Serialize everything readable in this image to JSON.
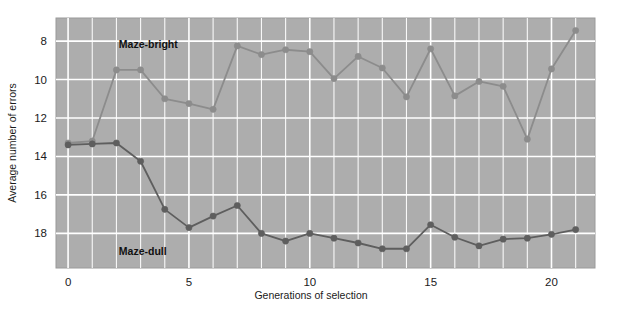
{
  "chart_data": {
    "type": "line",
    "title": "",
    "xlabel": "Generations of selection",
    "ylabel": "Average number of errors",
    "xlim": [
      -0.5,
      21.8
    ],
    "ylim": [
      19.8,
      6.8
    ],
    "y_inverted": true,
    "grid": true,
    "grid_color": "#ffffff",
    "plot_background": "#adadad",
    "legend_position": "inline-annotation",
    "xticks": [
      0,
      5,
      10,
      15,
      20
    ],
    "xtick_labels": [
      "0",
      "5",
      "10",
      "15",
      "20"
    ],
    "yticks": [
      8,
      10,
      12,
      14,
      16,
      18
    ],
    "ytick_labels": [
      "8",
      "10",
      "12",
      "14",
      "16",
      "18"
    ],
    "x_minor_step": 1,
    "y_minor_step": 1,
    "x": [
      0,
      1,
      2,
      3,
      4,
      5,
      6,
      7,
      8,
      9,
      10,
      11,
      12,
      13,
      14,
      15,
      16,
      17,
      18,
      19,
      20,
      21
    ],
    "series": [
      {
        "name": "Maze-bright",
        "color": "#8c8c8c",
        "marker": "circle",
        "annotation": "Maze-bright",
        "annotation_x": 2.1,
        "annotation_y": 8.35,
        "values": [
          13.3,
          13.2,
          9.5,
          9.5,
          11.0,
          11.25,
          11.55,
          8.25,
          8.7,
          8.45,
          8.55,
          9.95,
          8.8,
          9.4,
          10.9,
          8.4,
          10.85,
          10.1,
          10.35,
          13.1,
          9.45,
          7.45
        ]
      },
      {
        "name": "Maze-dull",
        "color": "#5e5e5e",
        "marker": "circle",
        "annotation": "Maze-dull",
        "annotation_x": 2.1,
        "annotation_y": 19.1,
        "values": [
          13.4,
          13.35,
          13.3,
          14.25,
          16.75,
          17.7,
          17.1,
          16.55,
          18.0,
          18.4,
          18.0,
          18.25,
          18.5,
          18.8,
          18.8,
          17.55,
          18.2,
          18.65,
          18.3,
          18.25,
          18.05,
          17.8
        ]
      }
    ]
  },
  "figure": {
    "frame_border_color": "#9a9a9a"
  }
}
